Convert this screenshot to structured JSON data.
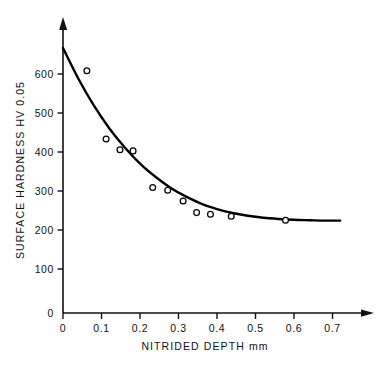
{
  "chart_data": {
    "type": "scatter",
    "title": "",
    "xlabel": "NITRIDED DEPTH mm",
    "ylabel": "SURFACE HARDNESS HV 0.05",
    "xlim": [
      0,
      0.78
    ],
    "ylim": [
      0,
      700
    ],
    "grid": false,
    "legend": "none",
    "x_ticks": [
      0,
      0.1,
      0.2,
      0.3,
      0.4,
      0.5,
      0.6,
      0.7
    ],
    "x_tick_labels": [
      "0",
      "0.1",
      "0.2",
      "0.3",
      "0.4",
      "0.5",
      "0.6",
      "0.7"
    ],
    "y_ticks": [
      0,
      100,
      200,
      300,
      400,
      500,
      600
    ],
    "y_tick_labels": [
      "0",
      "100",
      "200",
      "300",
      "400",
      "500",
      "600"
    ],
    "marker_style": "open-circle",
    "points": [
      {
        "x": 0.062,
        "y": 608
      },
      {
        "x": 0.112,
        "y": 437
      },
      {
        "x": 0.148,
        "y": 410
      },
      {
        "x": 0.182,
        "y": 407
      },
      {
        "x": 0.233,
        "y": 315
      },
      {
        "x": 0.272,
        "y": 308
      },
      {
        "x": 0.312,
        "y": 281
      },
      {
        "x": 0.347,
        "y": 252
      },
      {
        "x": 0.383,
        "y": 248
      },
      {
        "x": 0.437,
        "y": 243
      },
      {
        "x": 0.578,
        "y": 233
      }
    ],
    "fit_curve": {
      "name": "fitted decay curve",
      "x": [
        0.0,
        0.04,
        0.08,
        0.12,
        0.16,
        0.2,
        0.24,
        0.28,
        0.32,
        0.36,
        0.4,
        0.44,
        0.48,
        0.52,
        0.56,
        0.6,
        0.64,
        0.68,
        0.72
      ],
      "y": [
        665,
        588,
        521,
        464,
        416,
        375,
        342,
        314,
        292,
        274,
        261,
        251,
        244,
        239,
        236,
        234,
        233,
        232,
        232
      ]
    }
  },
  "axes": {
    "x_axis_name": "nitrided-depth-axis",
    "y_axis_name": "surface-hardness-axis"
  },
  "colors": {
    "ink": "#111111",
    "curve": "#000000",
    "marker_fill": "#ffffff",
    "background": "#ffffff"
  }
}
